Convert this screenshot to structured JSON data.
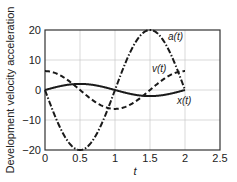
{
  "chart_data": {
    "type": "line",
    "title": "",
    "xlabel": "t",
    "ylabel": "Development velocity acceleration",
    "xlim": [
      0,
      2.5
    ],
    "ylim": [
      -20,
      20
    ],
    "xticks": [
      "0",
      "0.5",
      "1",
      "1.5",
      "2",
      "2.5"
    ],
    "yticks": [
      "20",
      "10",
      "0",
      "−10",
      "−20"
    ],
    "grid": true,
    "legend": "inline labels",
    "series": [
      {
        "name": "x(t)",
        "style": "solid",
        "x": [
          0,
          0.25,
          0.5,
          0.75,
          1,
          1.25,
          1.5,
          1.75,
          2
        ],
        "values": [
          0,
          1.43,
          2.03,
          1.43,
          0,
          -1.43,
          -2.03,
          -1.43,
          0
        ]
      },
      {
        "name": "v(t)",
        "style": "dashed",
        "x": [
          0,
          0.25,
          0.5,
          0.75,
          1,
          1.25,
          1.5,
          1.75,
          2
        ],
        "values": [
          6.3,
          4.45,
          0,
          -4.45,
          -6.3,
          -4.45,
          0,
          4.45,
          6.3
        ]
      },
      {
        "name": "a(t)",
        "style": "dash-dot",
        "x": [
          0,
          0.25,
          0.5,
          0.75,
          1,
          1.25,
          1.5,
          1.75,
          2
        ],
        "values": [
          0,
          -14.1,
          -20,
          -14.1,
          0,
          14.1,
          20,
          14.1,
          0
        ]
      }
    ]
  },
  "labels": {
    "a": "a(t)",
    "v": "v(t)",
    "x": "x(t)",
    "xlabel": "t",
    "ylabel": "Development velocity acceleration",
    "xticks": [
      "0",
      "0.5",
      "1",
      "1.5",
      "2",
      "2.5"
    ],
    "yticks": [
      "20",
      "10",
      "0",
      "−10",
      "−20"
    ]
  }
}
